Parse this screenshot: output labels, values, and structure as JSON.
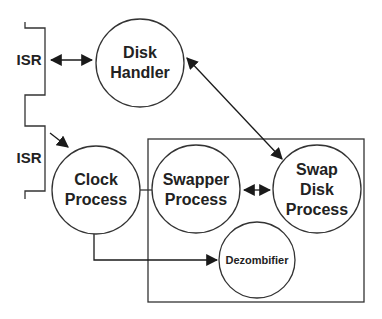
{
  "diagram": {
    "colors": {
      "stroke": "#333333",
      "text": "#222222",
      "background": "#ffffff"
    },
    "isr_labels": [
      {
        "id": "isr-top",
        "text": "ISR",
        "x": 29,
        "y": 60
      },
      {
        "id": "isr-bottom",
        "text": "ISR",
        "x": 29,
        "y": 158
      }
    ],
    "nodes": [
      {
        "id": "disk-handler",
        "lines": [
          "Disk",
          "Handler"
        ],
        "cx": 140,
        "cy": 63,
        "r": 44,
        "font_size": 16
      },
      {
        "id": "clock-process",
        "lines": [
          "Clock",
          "Process"
        ],
        "cx": 96,
        "cy": 190,
        "r": 44,
        "font_size": 16
      },
      {
        "id": "swapper-process",
        "lines": [
          "Swapper",
          "Process"
        ],
        "cx": 196,
        "cy": 189,
        "r": 44,
        "font_size": 16
      },
      {
        "id": "swap-disk-process",
        "lines": [
          "Swap",
          "Disk",
          "Process"
        ],
        "cx": 317,
        "cy": 189,
        "r": 44,
        "font_size": 16
      },
      {
        "id": "dezombifier",
        "lines": [
          "Dezombifier"
        ],
        "cx": 257,
        "cy": 260,
        "r": 38,
        "font_size": 11
      }
    ],
    "group_box": {
      "label": "",
      "x": 148,
      "y": 139,
      "width": 216,
      "height": 163
    },
    "edges": [
      {
        "from": "isr-top",
        "to": "disk-handler",
        "type": "bidirectional"
      },
      {
        "from": "disk-handler",
        "to": "swap-disk-process",
        "type": "bidirectional"
      },
      {
        "from": "isr-bottom",
        "to": "clock-process",
        "type": "directed"
      },
      {
        "from": "clock-process",
        "to": "swapper-process",
        "type": "line"
      },
      {
        "from": "swapper-process",
        "to": "swap-disk-process",
        "type": "bidirectional"
      },
      {
        "from": "clock-process",
        "to": "dezombifier",
        "type": "directed"
      }
    ]
  }
}
